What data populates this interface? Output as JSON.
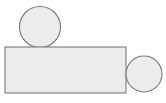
{
  "canvas": {
    "width": 166,
    "height": 103,
    "background_color": "#ffffff",
    "title": "geometric-shapes-diagram"
  },
  "style": {
    "fill_color": "#ececec",
    "stroke_color": "#7a7a7a",
    "stroke_width": 1.1
  },
  "chart_data": {
    "type": "diagram",
    "title": "",
    "xlabel": "",
    "ylabel": "",
    "shapes": [
      {
        "name": "top-circle",
        "kind": "circle",
        "cx": 40,
        "cy": 27,
        "r": 20.5,
        "fill": "#ececec",
        "stroke": "#7a7a7a",
        "label": ""
      },
      {
        "name": "main-rectangle",
        "kind": "rectangle",
        "x": 5,
        "y": 47,
        "width": 121,
        "height": 46,
        "fill": "#ececec",
        "stroke": "#7a7a7a",
        "label": ""
      },
      {
        "name": "right-circle",
        "kind": "circle",
        "cx": 144,
        "cy": 74,
        "r": 18,
        "fill": "#ececec",
        "stroke": "#7a7a7a",
        "label": ""
      }
    ]
  }
}
